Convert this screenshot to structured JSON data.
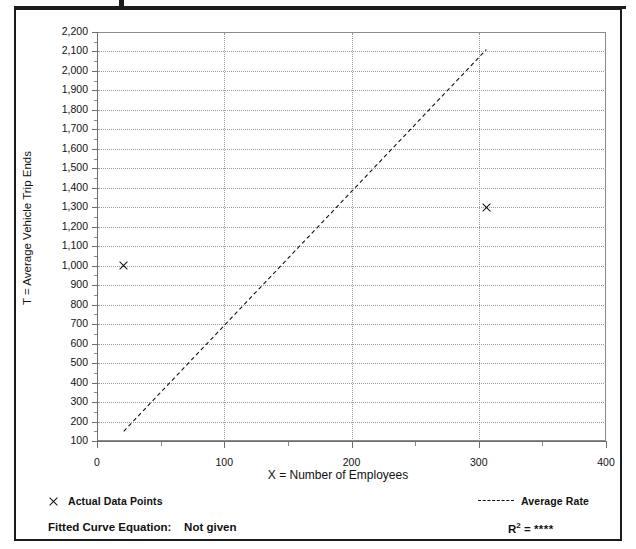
{
  "figure": {
    "title_fragment": "",
    "background": "#ffffff",
    "frame_color": "#1c1c1c"
  },
  "chart_data": {
    "type": "scatter",
    "title": "",
    "xlabel": "X = Number of Employees",
    "ylabel": "T = Average Vehicle Trip Ends",
    "xlim": [
      0,
      400
    ],
    "ylim": [
      100,
      2200
    ],
    "xticks": [
      0,
      100,
      200,
      300,
      400
    ],
    "xtick_labels": [
      "0",
      "100",
      "200",
      "300",
      "400"
    ],
    "yticks": [
      100,
      200,
      300,
      400,
      500,
      600,
      700,
      800,
      900,
      1000,
      1100,
      1200,
      1300,
      1400,
      1500,
      1600,
      1700,
      1800,
      1900,
      2000,
      2100,
      2200
    ],
    "ytick_labels": [
      "100",
      "200",
      "300",
      "400",
      "500",
      "600",
      "700",
      "800",
      "900",
      "1,000",
      "1,100",
      "1,200",
      "1,300",
      "1,400",
      "1,500",
      "1,600",
      "1,700",
      "1,800",
      "1,900",
      "2,000",
      "2,100",
      "2,200"
    ],
    "grid": true,
    "grid_style": "dotted",
    "legend_position": "below-plot",
    "series": [
      {
        "name": "Actual Data Points",
        "type": "scatter",
        "marker": "x",
        "color": "#111111",
        "points": [
          {
            "x": 21,
            "y": 1000
          },
          {
            "x": 306,
            "y": 1300
          }
        ]
      },
      {
        "name": "Average Rate",
        "type": "line",
        "style": "dashed",
        "color": "#111111",
        "x": [
          21,
          306
        ],
        "y": [
          150,
          2110
        ]
      }
    ]
  },
  "legend": {
    "actual_points_label": "Actual Data Points",
    "average_rate_label": "Average Rate"
  },
  "footer": {
    "equation_label": "Fitted Curve Equation:",
    "equation_value": "Not given",
    "r_squared_prefix": "R",
    "r_squared_exponent": "2",
    "r_squared_equals": " = ",
    "r_squared_value": "****"
  }
}
